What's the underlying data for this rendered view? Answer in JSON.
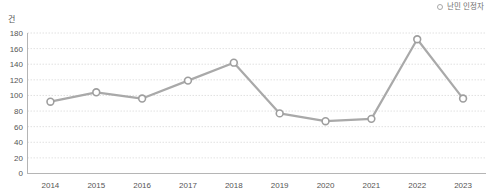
{
  "legend": {
    "position": "top-right",
    "entries": [
      {
        "label": "난민 인정자",
        "marker": "hollow-circle",
        "color": "#a8a8a8"
      }
    ]
  },
  "axis": {
    "unit_label": "건"
  },
  "colors": {
    "line": "#a9a9a9",
    "marker_stroke": "#9e9e9e",
    "marker_fill": "#ffffff",
    "grid": "#d9d9d9",
    "axis": "#b5b5b5",
    "text": "#555555"
  },
  "chart_data": {
    "type": "line",
    "title": "",
    "subtitle": "",
    "xlabel": "",
    "ylabel": "건",
    "categories": [
      "2014",
      "2015",
      "2016",
      "2017",
      "2018",
      "2019",
      "2020",
      "2021",
      "2022",
      "2023"
    ],
    "series": [
      {
        "name": "난민 인정자",
        "values": [
          92,
          104,
          96,
          119,
          142,
          77,
          67,
          70,
          172,
          96
        ]
      }
    ],
    "ylim": [
      0,
      180
    ],
    "ytick_values": [
      0,
      20,
      40,
      60,
      80,
      100,
      120,
      140,
      160,
      180
    ],
    "ytick_labels": [
      "0",
      "20",
      "40",
      "60",
      "80",
      "100",
      "120",
      "140",
      "160",
      "180"
    ],
    "xtick_labels": [
      "2014",
      "2015",
      "2016",
      "2017",
      "2018",
      "2019",
      "2020",
      "2021",
      "2022",
      "2023"
    ],
    "grid": true,
    "grid_style": "dotted-horizontal",
    "legend_position": "top-right",
    "markers": "hollow-circle"
  }
}
